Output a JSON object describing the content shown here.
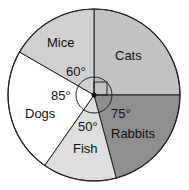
{
  "chart_data": {
    "type": "pie",
    "title": "",
    "unit": "degrees",
    "categories": [
      "Cats",
      "Rabbits",
      "Fish",
      "Dogs",
      "Mice"
    ],
    "values": [
      90,
      75,
      50,
      85,
      60
    ],
    "angle_labels": [
      "",
      "75°",
      "50°",
      "85°",
      "60°"
    ],
    "right_angle_marker": "Cats",
    "colors": [
      "#c2c2c2",
      "#8f8f8f",
      "#dedede",
      "#ffffff",
      "#d0d0d0"
    ],
    "start_angle": 0,
    "direction": "clockwise"
  },
  "labels": {
    "cats": "Cats",
    "rabbits": "Rabbits",
    "fish": "Fish",
    "dogs": "Dogs",
    "mice": "Mice",
    "angle_rabbits": "75°",
    "angle_fish": "50°",
    "angle_dogs": "85°",
    "angle_mice": "60°"
  }
}
